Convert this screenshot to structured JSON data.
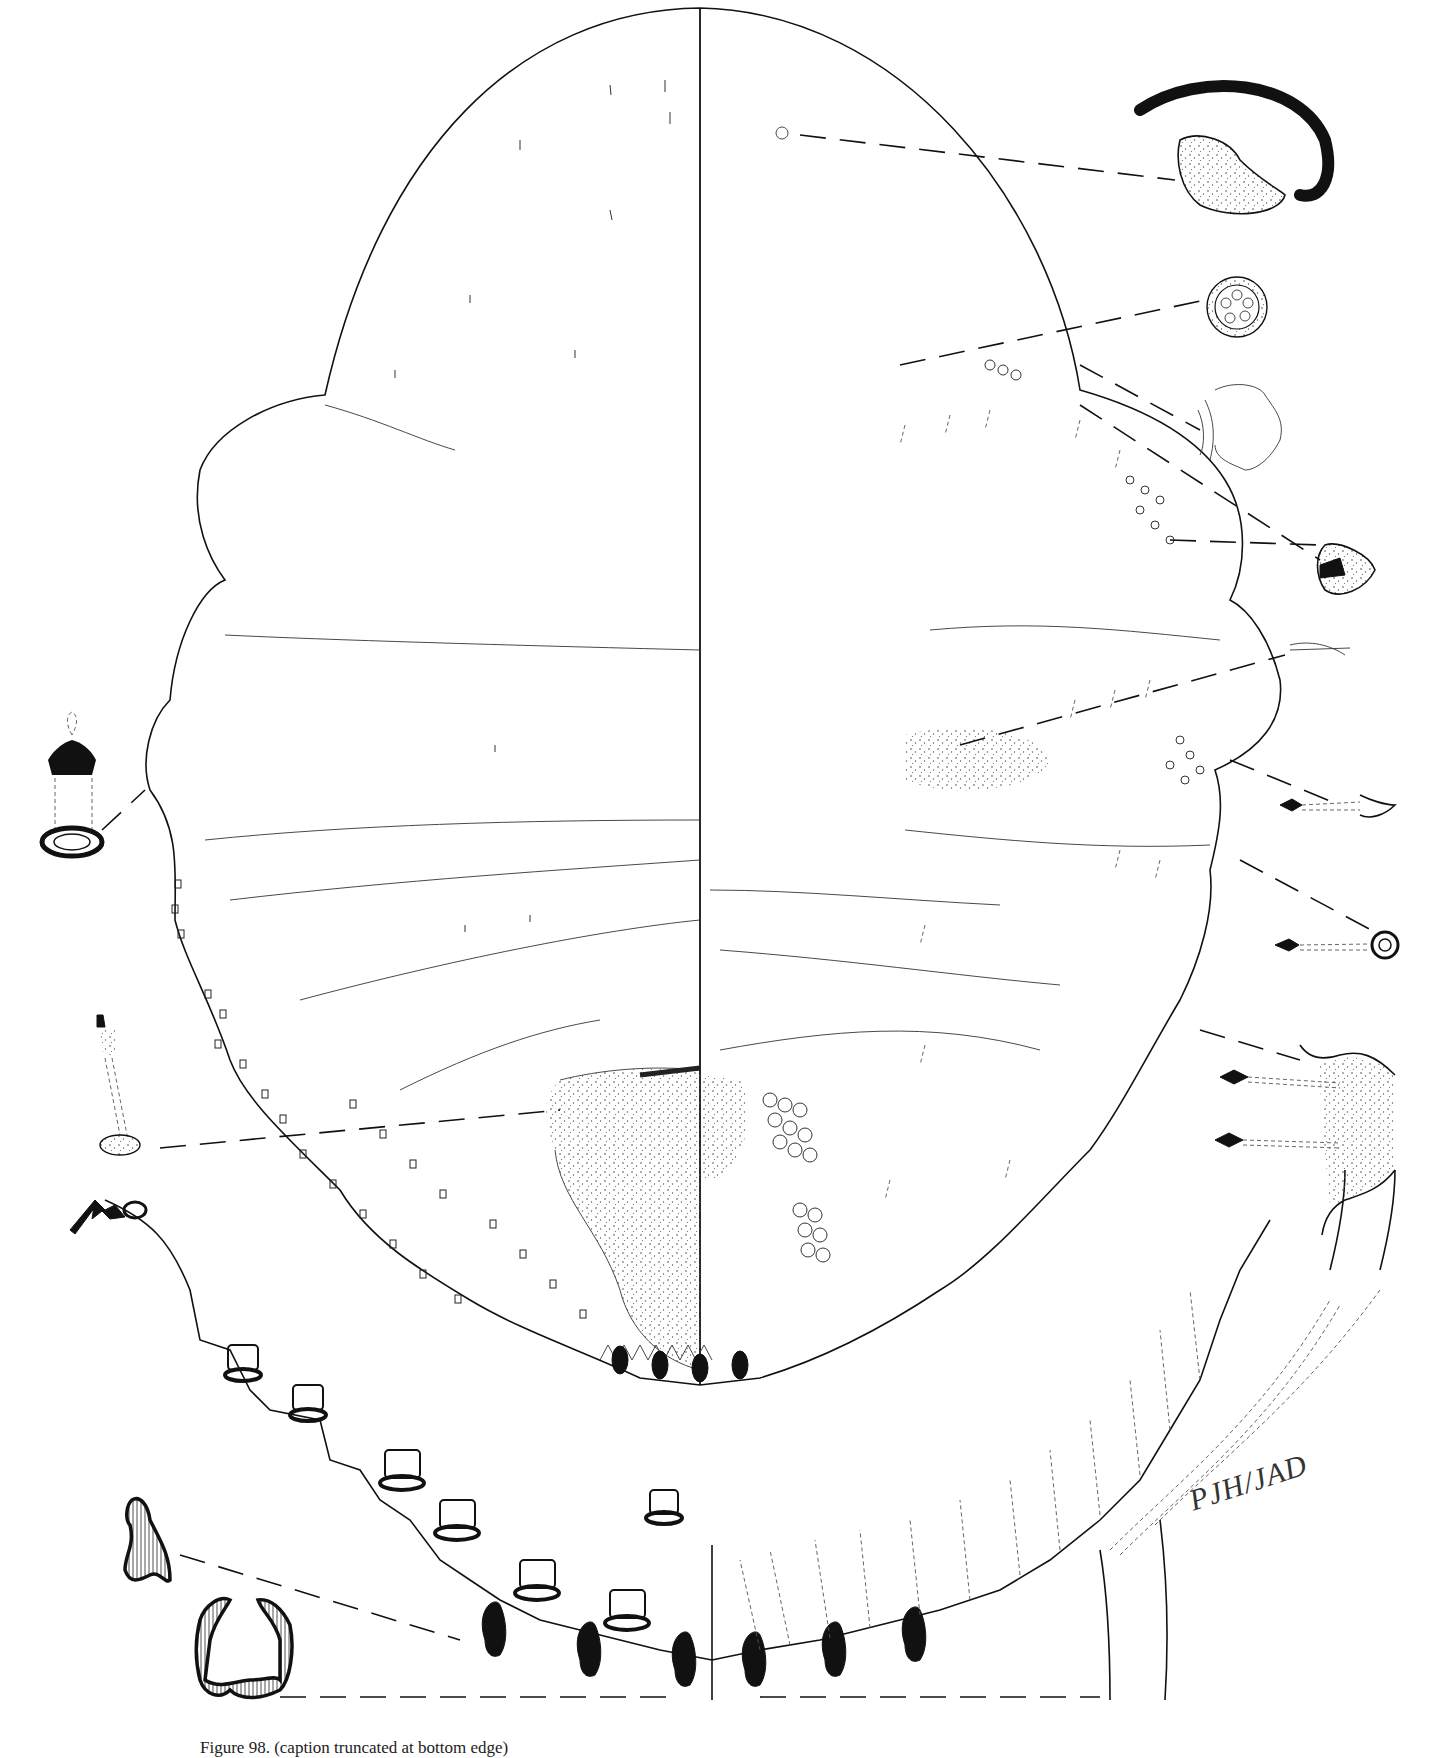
{
  "figure": {
    "type": "scientific line illustration",
    "signature": "PJH/JAD",
    "caption": "Figure 98. (caption truncated at bottom edge)"
  },
  "insets": [
    {
      "id": "antenna-detail",
      "position": "top-right",
      "label": "antenna/spiracle enlarged"
    },
    {
      "id": "multilocular-pore-detail",
      "position": "upper-right",
      "label": "multilocular disc pore"
    },
    {
      "id": "stigmatic-cleft-detail",
      "position": "upper-right-2",
      "label": "stigmatic cleft"
    },
    {
      "id": "ventral-seta-detail",
      "position": "right-middle",
      "label": "ventral setae"
    },
    {
      "id": "dorsal-tubular-duct-detail",
      "position": "left-middle",
      "label": "dorsal tubular duct"
    },
    {
      "id": "marginal-duct-detail",
      "position": "left-lower",
      "label": "marginal duct"
    },
    {
      "id": "anal-lobe-detail",
      "position": "bottom-right",
      "label": "anal lobe"
    },
    {
      "id": "marginal-spine-detail",
      "position": "bottom-left",
      "label": "marginal spines"
    }
  ]
}
